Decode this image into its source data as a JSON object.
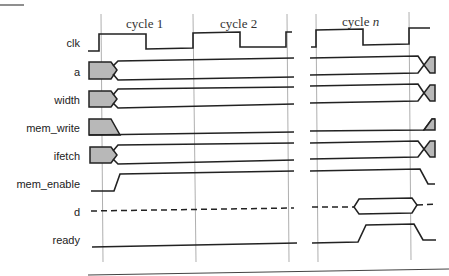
{
  "diagram": {
    "type": "timing-diagram",
    "cycles": [
      {
        "label": "cycle 1",
        "prefix": "cycle ",
        "suffix": "1",
        "italic_suffix": false
      },
      {
        "label": "cycle 2",
        "prefix": "cycle ",
        "suffix": "2",
        "italic_suffix": false
      },
      {
        "label": "cycle n",
        "prefix": "cycle ",
        "suffix": "n",
        "italic_suffix": true
      }
    ],
    "signals": [
      {
        "name": "clk",
        "kind": "clock"
      },
      {
        "name": "a",
        "kind": "bus",
        "behavior": "unknown then valid at cycle 1 start, changes after cycle n"
      },
      {
        "name": "width",
        "kind": "bus",
        "behavior": "unknown then valid at cycle 1 start, changes after cycle n"
      },
      {
        "name": "mem_write",
        "kind": "single",
        "behavior": "unknown then low during cycles, rises after cycle n"
      },
      {
        "name": "ifetch",
        "kind": "bus",
        "behavior": "unknown then valid at cycle 1 start, changes after cycle n"
      },
      {
        "name": "mem_enable",
        "kind": "single",
        "behavior": "rises in cycle 1, falls after cycle n"
      },
      {
        "name": "d",
        "kind": "data",
        "behavior": "high-impedance, valid data during cycle n"
      },
      {
        "name": "ready",
        "kind": "single",
        "behavior": "low, rises during cycle n, falls after cycle n"
      }
    ],
    "colors": {
      "line": "#222222",
      "unknown_fill": "#b8b8b8",
      "gridline": "#9a9a9a",
      "background": "#ffffff"
    }
  }
}
